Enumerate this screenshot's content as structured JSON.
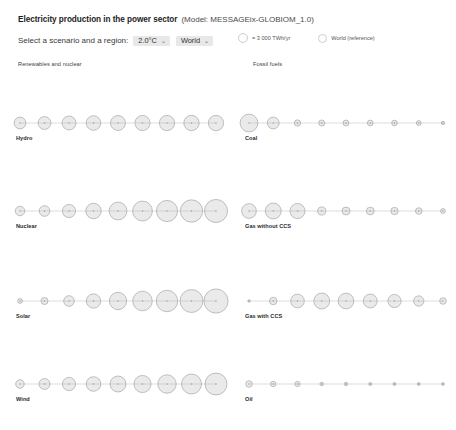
{
  "header": {
    "title": "Electricity production in the power sector",
    "model": "(Model: MESSAGEix-GLOBIOM_1.0)"
  },
  "controls": {
    "label": "Select a scenario and a region:",
    "scenario": {
      "value": "2.0°C",
      "caret": "⌄"
    },
    "region": {
      "value": "World",
      "caret": "⌄"
    }
  },
  "legend": {
    "size_label": "= 3 000 TWh/yr",
    "reference_label": "World (reference)"
  },
  "sections": {
    "left": "Renewables and nuclear",
    "right": "Fossil fuels"
  },
  "chart_data": {
    "type": "scatter",
    "title": "Electricity production in the power sector",
    "unit": "TWh/yr",
    "legend_bubble_value": 3000,
    "x": [
      2020,
      2030,
      2040,
      2050,
      2060,
      2070,
      2080,
      2090,
      2100
    ],
    "series": [
      {
        "name": "Hydro",
        "column": "left",
        "values": [
          4200,
          5000,
          5800,
          6400,
          6700,
          6900,
          7000,
          7050,
          7100
        ]
      },
      {
        "name": "Nuclear",
        "column": "left",
        "values": [
          2700,
          3400,
          5200,
          7200,
          9500,
          11800,
          13500,
          15000,
          16000
        ]
      },
      {
        "name": "Solar",
        "column": "left",
        "values": [
          700,
          1500,
          3400,
          6200,
          9000,
          11500,
          13800,
          15800,
          17500
        ]
      },
      {
        "name": "Wind",
        "column": "left",
        "values": [
          2200,
          3600,
          5200,
          6400,
          7600,
          8800,
          10200,
          12000,
          14500
        ]
      },
      {
        "name": "Coal",
        "column": "right",
        "values": [
          9500,
          4200,
          1200,
          1100,
          1050,
          1000,
          950,
          700,
          350
        ]
      },
      {
        "name": "Gas without CCS",
        "column": "right",
        "values": [
          6500,
          7600,
          6800,
          2000,
          1900,
          1800,
          1600,
          1300,
          700
        ]
      },
      {
        "name": "Gas with CCS",
        "column": "right",
        "values": [
          200,
          1700,
          5600,
          7600,
          7400,
          5800,
          5200,
          3200,
          1300
        ]
      },
      {
        "name": "Oil",
        "column": "right",
        "values": [
          1300,
          900,
          850,
          400,
          350,
          300,
          280,
          260,
          240
        ]
      }
    ],
    "xlabel": "",
    "ylabel": "",
    "grid": false,
    "legend_position": "top-right"
  }
}
